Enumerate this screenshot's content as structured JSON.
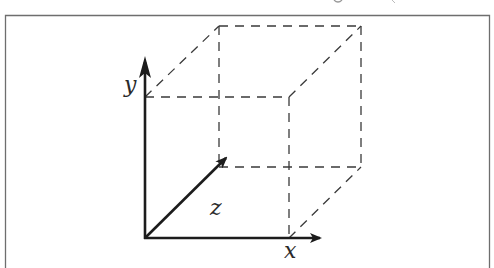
{
  "figure": {
    "type": "3d-coordinate-axes-with-dashed-cube",
    "colors": {
      "background": "#ffffff",
      "frame": "#6e6e6e",
      "axis": "#1c1c1c",
      "dashed_edges": "#3a3a3a",
      "label": "#2a2a2a"
    },
    "frame": {
      "left": 5,
      "top": 15,
      "right": 490,
      "bottom_open": true
    },
    "axes": [
      {
        "name": "x",
        "label": "x",
        "from": [
          145,
          238
        ],
        "to": [
          322,
          238
        ]
      },
      {
        "name": "y",
        "label": "y",
        "from": [
          145,
          238
        ],
        "to": [
          145,
          57
        ]
      },
      {
        "name": "z",
        "label": "z",
        "from": [
          145,
          238
        ],
        "to": [
          228,
          156
        ]
      }
    ],
    "labels": {
      "x": "x",
      "y": "y",
      "z": "z"
    },
    "cube": {
      "front_face": {
        "top_left": [
          145,
          97
        ],
        "top_right": [
          289,
          97
        ],
        "bottom_right": [
          289,
          238
        ],
        "bottom_left": [
          145,
          238
        ]
      },
      "back_face": {
        "top_left": [
          219,
          26
        ],
        "top_right": [
          361,
          26
        ],
        "bottom_right": [
          361,
          167
        ],
        "bottom_left": [
          219,
          167
        ]
      },
      "edge_style": "dashed"
    }
  }
}
